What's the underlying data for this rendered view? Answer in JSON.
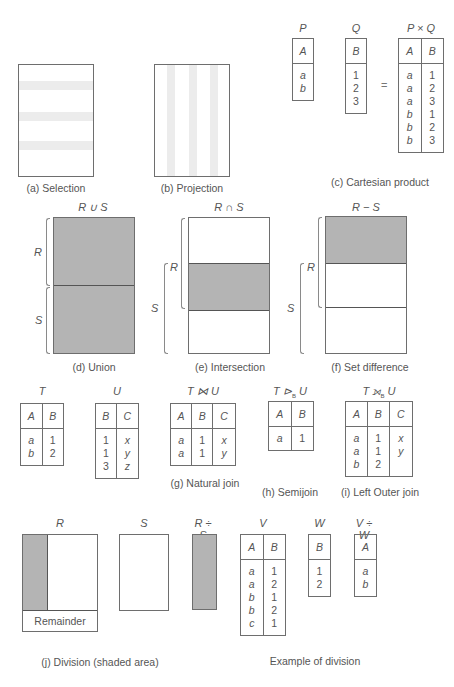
{
  "panels": {
    "selection": {
      "caption": "(a) Selection"
    },
    "projection": {
      "caption": "(b) Projection"
    },
    "cartesian": {
      "caption": "(c) Cartesian product",
      "equals": "=",
      "P": {
        "title": "P",
        "headers": [
          "A"
        ],
        "rows": [
          [
            "a"
          ],
          [
            "b"
          ]
        ]
      },
      "Q": {
        "title": "Q",
        "headers": [
          "B"
        ],
        "rows": [
          [
            "1"
          ],
          [
            "2"
          ],
          [
            "3"
          ]
        ]
      },
      "PxQ": {
        "title": "P × Q",
        "headers": [
          "A",
          "B"
        ],
        "rows": [
          [
            "a",
            "1"
          ],
          [
            "a",
            "2"
          ],
          [
            "a",
            "3"
          ],
          [
            "b",
            "1"
          ],
          [
            "b",
            "2"
          ],
          [
            "b",
            "3"
          ]
        ]
      }
    },
    "union": {
      "title": "R ∪ S",
      "caption": "(d) Union",
      "labels": {
        "R": "R",
        "S": "S"
      }
    },
    "intersection": {
      "title": "R ∩ S",
      "caption": "(e) Intersection",
      "labels": {
        "R": "R",
        "S": "S"
      }
    },
    "difference": {
      "title": "R − S",
      "caption": "(f) Set difference",
      "labels": {
        "R": "R",
        "S": "S"
      }
    },
    "T": {
      "title": "T",
      "headers": [
        "A",
        "B"
      ],
      "rows": [
        [
          "a",
          "1"
        ],
        [
          "b",
          "2"
        ]
      ]
    },
    "U": {
      "title": "U",
      "headers": [
        "B",
        "C"
      ],
      "rows": [
        [
          "1",
          "x"
        ],
        [
          "1",
          "y"
        ],
        [
          "3",
          "z"
        ]
      ]
    },
    "natural_join": {
      "title": "T ⋈ U",
      "caption": "(g) Natural join",
      "headers": [
        "A",
        "B",
        "C"
      ],
      "rows": [
        [
          "a",
          "1",
          "x"
        ],
        [
          "a",
          "1",
          "y"
        ]
      ]
    },
    "semijoin": {
      "title_pre": "T ⊳",
      "title_sub": "B",
      "title_post": " U",
      "caption": "(h) Semijoin",
      "headers": [
        "A",
        "B"
      ],
      "rows": [
        [
          "a",
          "1"
        ]
      ]
    },
    "left_outer_join": {
      "title_pre": "T ⟕",
      "title_sub": "B",
      "title_post": " U",
      "caption": "(i) Left Outer join",
      "headers": [
        "A",
        "B",
        "C"
      ],
      "rows": [
        [
          "a",
          "1",
          "x"
        ],
        [
          "a",
          "1",
          "y"
        ],
        [
          "b",
          "2",
          ""
        ]
      ]
    },
    "division": {
      "caption": "(j) Division (shaded area)",
      "R_title": "R",
      "S_title": "S",
      "RdivS_title": "R ÷ S",
      "remainder_label": "Remainder"
    },
    "division_example": {
      "caption": "Example of division",
      "V": {
        "title": "V",
        "headers": [
          "A",
          "B"
        ],
        "rows": [
          [
            "a",
            "1"
          ],
          [
            "a",
            "2"
          ],
          [
            "b",
            "1"
          ],
          [
            "b",
            "2"
          ],
          [
            "c",
            "1"
          ]
        ]
      },
      "W": {
        "title": "W",
        "headers": [
          "B"
        ],
        "rows": [
          [
            "1"
          ],
          [
            "2"
          ]
        ]
      },
      "VdivW": {
        "title": "V ÷ W",
        "headers": [
          "A"
        ],
        "rows": [
          [
            "a"
          ],
          [
            "b"
          ]
        ]
      }
    }
  },
  "colors": {
    "shade": "#b4b4b4",
    "line": "#6e6e6e",
    "stripe": "#ececec"
  }
}
